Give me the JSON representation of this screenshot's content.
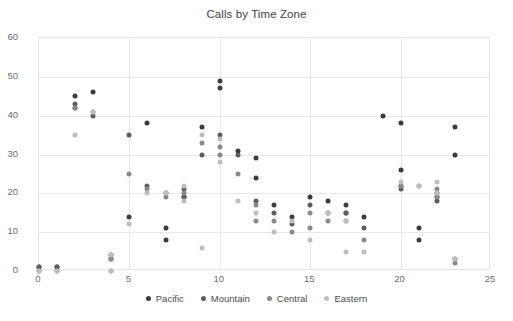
{
  "chart_data": {
    "type": "scatter",
    "title": "Calls by Time Zone",
    "xlabel": "",
    "ylabel": "",
    "xlim": [
      0,
      25
    ],
    "ylim": [
      0,
      60
    ],
    "xticks": [
      0,
      5,
      10,
      15,
      20,
      25
    ],
    "yticks": [
      0,
      10,
      20,
      30,
      40,
      50,
      60
    ],
    "grid": true,
    "legend_position": "bottom",
    "colors": {
      "Pacific": "#3c3c3c",
      "Mountain": "#5e5e5e",
      "Central": "#8a8a8a",
      "Eastern": "#bdbdbd"
    },
    "series": [
      {
        "name": "Pacific",
        "color": "#3c3c3c",
        "points": [
          [
            0,
            1
          ],
          [
            1,
            1
          ],
          [
            2,
            45
          ],
          [
            3,
            46
          ],
          [
            4,
            4
          ],
          [
            5,
            14
          ],
          [
            6,
            38
          ],
          [
            7,
            11
          ],
          [
            7,
            8
          ],
          [
            8,
            19
          ],
          [
            9,
            37
          ],
          [
            10,
            49
          ],
          [
            10,
            47
          ],
          [
            11,
            31
          ],
          [
            12,
            29
          ],
          [
            12,
            24
          ],
          [
            13,
            17
          ],
          [
            14,
            14
          ],
          [
            15,
            19
          ],
          [
            16,
            18
          ],
          [
            17,
            17
          ],
          [
            17,
            15
          ],
          [
            18,
            14
          ],
          [
            19,
            40
          ],
          [
            20,
            38
          ],
          [
            20,
            26
          ],
          [
            21,
            11
          ],
          [
            21,
            8
          ],
          [
            22,
            19
          ],
          [
            23,
            37
          ],
          [
            23,
            30
          ]
        ]
      },
      {
        "name": "Mountain",
        "color": "#5e5e5e",
        "points": [
          [
            0,
            1
          ],
          [
            1,
            1
          ],
          [
            2,
            43
          ],
          [
            2,
            42
          ],
          [
            3,
            40
          ],
          [
            4,
            3
          ],
          [
            5,
            35
          ],
          [
            6,
            22
          ],
          [
            7,
            20
          ],
          [
            8,
            21
          ],
          [
            8,
            19
          ],
          [
            9,
            30
          ],
          [
            10,
            35
          ],
          [
            11,
            30
          ],
          [
            12,
            18
          ],
          [
            13,
            15
          ],
          [
            14,
            12
          ],
          [
            15,
            17
          ],
          [
            16,
            15
          ],
          [
            17,
            15
          ],
          [
            18,
            11
          ],
          [
            20,
            22
          ],
          [
            20,
            21
          ],
          [
            22,
            20
          ],
          [
            22,
            18
          ],
          [
            23,
            3
          ]
        ]
      },
      {
        "name": "Central",
        "color": "#8a8a8a",
        "points": [
          [
            0,
            0
          ],
          [
            1,
            0
          ],
          [
            2,
            42
          ],
          [
            3,
            41
          ],
          [
            4,
            3
          ],
          [
            4,
            0
          ],
          [
            5,
            25
          ],
          [
            6,
            21
          ],
          [
            7,
            19
          ],
          [
            8,
            20
          ],
          [
            9,
            33
          ],
          [
            10,
            32
          ],
          [
            10,
            30
          ],
          [
            11,
            25
          ],
          [
            12,
            17
          ],
          [
            12,
            13
          ],
          [
            13,
            13
          ],
          [
            14,
            10
          ],
          [
            15,
            15
          ],
          [
            15,
            11
          ],
          [
            16,
            13
          ],
          [
            17,
            13
          ],
          [
            18,
            8
          ],
          [
            20,
            22
          ],
          [
            21,
            22
          ],
          [
            22,
            21
          ],
          [
            22,
            19
          ],
          [
            23,
            2
          ]
        ]
      },
      {
        "name": "Eastern",
        "color": "#bdbdbd",
        "points": [
          [
            0,
            0
          ],
          [
            1,
            0
          ],
          [
            2,
            35
          ],
          [
            3,
            41
          ],
          [
            4,
            4
          ],
          [
            4,
            0
          ],
          [
            5,
            12
          ],
          [
            6,
            20
          ],
          [
            7,
            20
          ],
          [
            8,
            22
          ],
          [
            8,
            18
          ],
          [
            9,
            6
          ],
          [
            9,
            35
          ],
          [
            10,
            34
          ],
          [
            10,
            28
          ],
          [
            11,
            18
          ],
          [
            12,
            15
          ],
          [
            13,
            10
          ],
          [
            14,
            13
          ],
          [
            15,
            8
          ],
          [
            16,
            15
          ],
          [
            17,
            13
          ],
          [
            17,
            5
          ],
          [
            18,
            5
          ],
          [
            20,
            23
          ],
          [
            21,
            22
          ],
          [
            22,
            23
          ],
          [
            22,
            20
          ],
          [
            23,
            3
          ]
        ]
      }
    ]
  },
  "legend": {
    "items": [
      {
        "label": "Pacific"
      },
      {
        "label": "Mountain"
      },
      {
        "label": "Central"
      },
      {
        "label": "Eastern"
      }
    ]
  }
}
